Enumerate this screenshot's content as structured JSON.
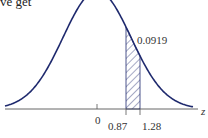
{
  "top_text": "ve get",
  "diagram": {
    "type": "normal-distribution-curve",
    "curve_color": "#1f2a6e",
    "axis_color": "#555555",
    "shaded_region": {
      "from_z": 0.87,
      "to_z": 1.28,
      "pattern": "diagonal-hatch"
    },
    "area_label": "0.0919",
    "axis_variable": "z",
    "tick_labels": {
      "zero": "0",
      "lower": "0.87",
      "upper": "1.28"
    }
  }
}
